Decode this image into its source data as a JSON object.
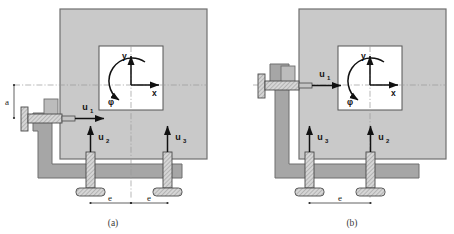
{
  "figure": {
    "panels": [
      {
        "id": "a",
        "caption": "(a)",
        "coordinate_frame": {
          "x_label": "x",
          "y_label": "y",
          "rotation_label": "φ"
        },
        "actuators": [
          {
            "name": "u1",
            "label": "u",
            "subscript": "1",
            "orientation": "horizontal",
            "direction": "right"
          },
          {
            "name": "u2",
            "label": "u",
            "subscript": "2",
            "orientation": "vertical",
            "direction": "up"
          },
          {
            "name": "u3",
            "label": "u",
            "subscript": "3",
            "orientation": "vertical",
            "direction": "up"
          }
        ],
        "dimensions": [
          {
            "name": "a",
            "label": "a",
            "orientation": "vertical"
          },
          {
            "name": "e-left",
            "label": "e",
            "orientation": "horizontal"
          },
          {
            "name": "e-right",
            "label": "e",
            "orientation": "horizontal"
          }
        ]
      },
      {
        "id": "b",
        "caption": "(b)",
        "coordinate_frame": {
          "x_label": "x",
          "y_label": "y",
          "rotation_label": "φ"
        },
        "actuators": [
          {
            "name": "u1",
            "label": "u",
            "subscript": "1",
            "orientation": "horizontal",
            "direction": "right"
          },
          {
            "name": "u3",
            "label": "u",
            "subscript": "3",
            "orientation": "vertical",
            "direction": "up"
          },
          {
            "name": "u2",
            "label": "u",
            "subscript": "2",
            "orientation": "vertical",
            "direction": "up"
          }
        ],
        "dimensions": [
          {
            "name": "e",
            "label": "e",
            "orientation": "horizontal"
          }
        ]
      }
    ],
    "colors": {
      "plate": "#c9c9c9",
      "plate_edge": "#707070",
      "bracket": "#a6a6a6",
      "bracket_edge": "#6e6e6e",
      "window": "#ffffff",
      "window_edge": "#555555",
      "actuator_body": "#d2d2d2",
      "actuator_edge": "#4a4a4a",
      "arrow": "#111111",
      "centerline": "#9a9a9a",
      "dimension": "#3a3a3a",
      "background": "#ffffff"
    }
  }
}
